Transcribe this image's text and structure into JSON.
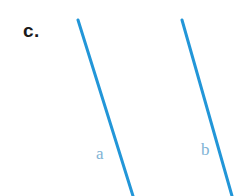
{
  "figure": {
    "part_label": "c.",
    "part_label_color": "#1a1a1a",
    "background_color": "#ffffff",
    "width": 238,
    "height": 196
  },
  "chart_data": {
    "type": "line",
    "title": "c.",
    "xlabel": "",
    "ylabel": "",
    "grid": false,
    "legend": "none",
    "xlim": [
      0,
      238
    ],
    "ylim": [
      196,
      0
    ],
    "annotations": [
      {
        "text": "c.",
        "x": 24,
        "y": 33,
        "color": "#1a1a1a",
        "style": "bold"
      },
      {
        "text": "a",
        "x": 101,
        "y": 157,
        "color": "#7fb3d5",
        "style": "serif"
      },
      {
        "text": "b",
        "x": 206,
        "y": 153,
        "color": "#7fb3d5",
        "style": "serif"
      }
    ],
    "series": [
      {
        "name": "a",
        "color": "#2296d8",
        "width": 3,
        "x": [
          78,
          133
        ],
        "y": [
          20,
          196
        ]
      },
      {
        "name": "b",
        "color": "#2296d8",
        "width": 3,
        "x": [
          182,
          232
        ],
        "y": [
          20,
          196
        ]
      }
    ]
  },
  "lines": {
    "a": {
      "label": "a",
      "color": "#2296d8",
      "stroke_width": 3,
      "x1": 78,
      "y1": 20,
      "x2": 133,
      "y2": 196
    },
    "b": {
      "label": "b",
      "color": "#2296d8",
      "stroke_width": 3,
      "x1": 182,
      "y1": 20,
      "x2": 232,
      "y2": 196
    }
  },
  "label_style": {
    "line_label_color": "#7fb3d5"
  }
}
